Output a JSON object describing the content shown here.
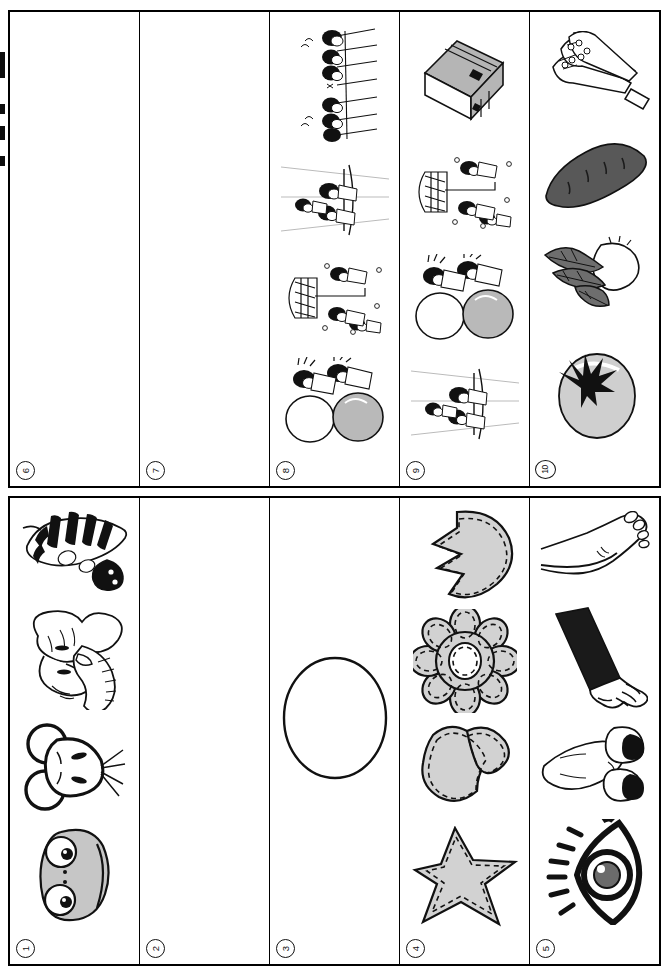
{
  "document": {
    "kind": "scanned-worksheet-page",
    "orientation": "rotated-90",
    "section_count": 2,
    "columns_per_section": 5
  },
  "sections": [
    {
      "name": "top-strip",
      "columns": [
        {
          "number": "6",
          "empty": true,
          "items": []
        },
        {
          "number": "7",
          "empty": true,
          "items": []
        },
        {
          "number": "8",
          "empty": false,
          "items": [
            {
              "icon": "children-climbing-net-icon",
              "label": "children climbing net"
            },
            {
              "icon": "children-jump-rope-icon",
              "label": "children at high jump bar"
            },
            {
              "icon": "children-net-throw-icon",
              "label": "children with net and bar"
            },
            {
              "icon": "children-big-ball-icon",
              "label": "children rolling big balls"
            }
          ]
        },
        {
          "number": "9",
          "empty": false,
          "items": [
            {
              "icon": "cardboard-box-icon",
              "label": "cardboard box"
            },
            {
              "icon": "children-net-throw-icon",
              "label": "children with net and bar"
            },
            {
              "icon": "children-big-ball-icon",
              "label": "children rolling big balls"
            },
            {
              "icon": "children-jump-rope-icon",
              "label": "children at high jump bar"
            }
          ]
        },
        {
          "number": "10",
          "empty": false,
          "items": [
            {
              "icon": "asparagus-icon",
              "label": "asparagus bunch"
            },
            {
              "icon": "sweet-potato-icon",
              "label": "sweet potato"
            },
            {
              "icon": "turnip-with-greens-icon",
              "label": "turnip with greens"
            },
            {
              "icon": "tomato-icon",
              "label": "tomato"
            }
          ]
        }
      ]
    },
    {
      "name": "bottom-strip",
      "columns": [
        {
          "number": "1",
          "empty": false,
          "items": [
            {
              "icon": "zebra-head-icon",
              "label": "zebra head"
            },
            {
              "icon": "elephant-head-icon",
              "label": "elephant head"
            },
            {
              "icon": "mouse-head-icon",
              "label": "mouse head"
            },
            {
              "icon": "frog-face-icon",
              "label": "frog face"
            }
          ]
        },
        {
          "number": "2",
          "empty": true,
          "items": []
        },
        {
          "number": "3",
          "empty": false,
          "items": [
            {
              "icon": "circle-outline-icon",
              "label": "empty circle outline"
            }
          ]
        },
        {
          "number": "4",
          "empty": false,
          "items": [
            {
              "icon": "pacman-heart-felt-icon",
              "label": "notched round felt shape"
            },
            {
              "icon": "flower-felt-icon",
              "label": "flower felt shape"
            },
            {
              "icon": "heart-felt-icon",
              "label": "heart felt shape"
            },
            {
              "icon": "star-felt-icon",
              "label": "star felt shape"
            }
          ]
        },
        {
          "number": "5",
          "empty": false,
          "items": [
            {
              "icon": "foot-icon",
              "label": "foot"
            },
            {
              "icon": "arm-hand-icon",
              "label": "arm and hand"
            },
            {
              "icon": "nose-icon",
              "label": "nose"
            },
            {
              "icon": "eye-icon",
              "label": "eye"
            }
          ]
        }
      ]
    }
  ],
  "colors": {
    "ink": "#111111",
    "felt_gray": "#d2d2d2",
    "mid_gray": "#9a9a9a",
    "paper": "#ffffff"
  },
  "scan_marks": [
    {
      "top": 52,
      "height": 26
    },
    {
      "top": 104,
      "height": 10
    },
    {
      "top": 126,
      "height": 14
    },
    {
      "top": 156,
      "height": 10
    }
  ]
}
